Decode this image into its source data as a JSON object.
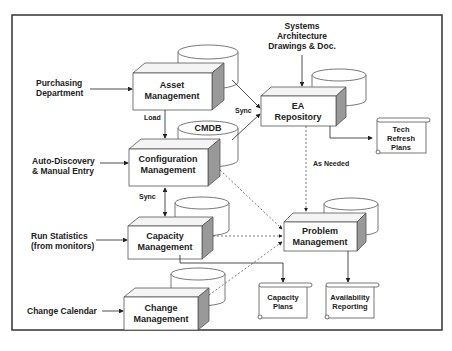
{
  "diagram": {
    "inputs": {
      "purchasing": [
        "Purchasing",
        "Department"
      ],
      "autodiscovery": [
        "Auto-Discovery",
        "& Manual Entry"
      ],
      "runstats": [
        "Run Statistics",
        "(from monitors)"
      ],
      "changecal": [
        "Change Calendar"
      ],
      "systems": [
        "Systems",
        "Architecture",
        "Drawings & Doc."
      ]
    },
    "processes": {
      "asset": [
        "Asset",
        "Management"
      ],
      "config": [
        "Configuration",
        "Management"
      ],
      "capacity": [
        "Capacity",
        "Management"
      ],
      "change": [
        "Change",
        "Management"
      ],
      "ea": [
        "EA",
        "Repository"
      ],
      "problem": [
        "Problem",
        "Management"
      ]
    },
    "databases": {
      "cmdb": "CMDB"
    },
    "outputs": {
      "techrefresh": [
        "Tech",
        "Refresh",
        "Plans"
      ],
      "capplans": [
        "Capacity",
        "Plans"
      ],
      "availability": [
        "Availability",
        "Reporting"
      ]
    },
    "edge_labels": {
      "load": "Load",
      "sync_ea": "Sync",
      "sync_cap": "Sync",
      "as_needed": "As Needed"
    }
  }
}
